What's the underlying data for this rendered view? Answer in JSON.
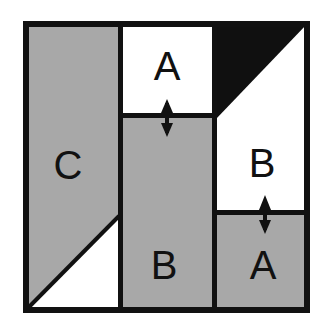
{
  "figure": {
    "canvas": {
      "width": 320,
      "height": 322,
      "background": "#ffffff"
    }
  },
  "colors": {
    "outline": "#111111",
    "shaded_fill": "#a8a8a8",
    "white_fill": "#ffffff",
    "black_fill": "#101010",
    "label_color": "#111111",
    "arrow_color": "#111111"
  },
  "frame": {
    "x": 23,
    "y": 21,
    "width": 287,
    "height": 292,
    "stroke_width": 6
  },
  "columns": [
    {
      "name": "left-column",
      "x": 26,
      "width": 93
    },
    {
      "name": "middle-column",
      "x": 122,
      "width": 90
    },
    {
      "name": "right-column",
      "x": 216,
      "width": 91
    }
  ],
  "pieces": [
    {
      "id": "piece-c-left",
      "label": "C",
      "fill": "shaded",
      "shape": "polygon",
      "points": "26,24 119,24 119,216 26,310",
      "label_x": 68,
      "label_y": 165
    },
    {
      "id": "piece-left-white-triangle",
      "label": "",
      "fill": "white",
      "shape": "polygon",
      "points": "119,216 119,310 26,310"
    },
    {
      "id": "piece-a-top-middle",
      "label": "A",
      "fill": "white",
      "shape": "rect",
      "x": 122,
      "y": 24,
      "width": 90,
      "height": 90,
      "label_x": 167,
      "label_y": 66
    },
    {
      "id": "piece-b-middle",
      "label": "B",
      "fill": "shaded",
      "shape": "rect",
      "x": 122,
      "y": 117,
      "width": 90,
      "height": 193,
      "label_x": 167,
      "label_y": 265
    },
    {
      "id": "piece-black-triangle",
      "label": "",
      "fill": "black",
      "shape": "polygon",
      "points": "216,24 307,24 216,119"
    },
    {
      "id": "piece-b-right",
      "label": "B",
      "fill": "white",
      "shape": "polygon",
      "points": "307,24 307,211 216,211 216,119",
      "label_x": 262,
      "label_y": 163
    },
    {
      "id": "piece-a-bottom-right",
      "label": "A",
      "fill": "shaded",
      "shape": "rect",
      "x": 216,
      "y": 214,
      "width": 91,
      "height": 96,
      "label_x": 262,
      "label_y": 265
    }
  ],
  "dividers": [
    {
      "name": "divider-vertical-left",
      "x1": 119,
      "y1": 21,
      "x2": 119,
      "y2": 313
    },
    {
      "name": "divider-vertical-right",
      "x1": 213,
      "y1": 21,
      "x2": 213,
      "y2": 313
    },
    {
      "name": "divider-horizontal-middle",
      "x1": 119,
      "y1": 115,
      "x2": 213,
      "y2": 115
    },
    {
      "name": "divider-horizontal-right",
      "x1": 213,
      "y1": 212,
      "x2": 310,
      "y2": 212
    }
  ],
  "arrows": [
    {
      "name": "gap-arrow-upper",
      "x": 167,
      "y_top": 100,
      "y_bottom": 136,
      "double_headed": true
    },
    {
      "name": "gap-arrow-lower",
      "x": 265,
      "y_top": 196,
      "y_bottom": 233,
      "double_headed": true
    }
  ],
  "labels": {
    "a_top": "A",
    "b_middle": "B",
    "c_left": "C",
    "b_right": "B",
    "a_bottom": "A"
  }
}
